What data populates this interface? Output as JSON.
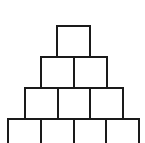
{
  "figure": {
    "title": "Square Pyramid Stack",
    "background_color": "#ffffff",
    "stroke_color": "#1a1a1a",
    "fill_color": "#ffffff",
    "stroke_width": 2,
    "canvas": {
      "width": 145,
      "height": 143
    }
  },
  "chart_data": {
    "type": "bar",
    "title": "Square Pyramid Stack",
    "subtitle": "",
    "xlabel": "",
    "ylabel": "",
    "categories": [
      "Row 1",
      "Row 2",
      "Row 3",
      "Row 4"
    ],
    "values": [
      1,
      2,
      3,
      4
    ],
    "ylim": [
      0,
      4
    ],
    "grid": false,
    "legend": "none",
    "annotations": [],
    "total_squares": 10,
    "square_size": {
      "width": 33,
      "height": 31
    },
    "rows": [
      {
        "index": 1,
        "label": "Row 1",
        "count": 1,
        "y": 26,
        "height": 31,
        "left": 57,
        "width": 33,
        "clipped": false
      },
      {
        "index": 2,
        "label": "Row 2",
        "count": 2,
        "y": 57,
        "height": 31,
        "left": 41,
        "width": 66,
        "clipped": false
      },
      {
        "index": 3,
        "label": "Row 3",
        "count": 3,
        "y": 88,
        "height": 31,
        "left": 25,
        "width": 98,
        "clipped": false
      },
      {
        "index": 4,
        "label": "Row 4",
        "count": 4,
        "y": 119,
        "height": 31,
        "left": 8,
        "width": 131,
        "clipped": true
      }
    ],
    "squares": [
      {
        "id": "r1c1",
        "row": 1,
        "col": 1,
        "x": 57,
        "y": 26,
        "w": 33,
        "h": 31
      },
      {
        "id": "r2c1",
        "row": 2,
        "col": 1,
        "x": 41,
        "y": 57,
        "w": 33,
        "h": 31
      },
      {
        "id": "r2c2",
        "row": 2,
        "col": 2,
        "x": 74,
        "y": 57,
        "w": 33,
        "h": 31
      },
      {
        "id": "r3c1",
        "row": 3,
        "col": 1,
        "x": 25,
        "y": 88,
        "w": 33,
        "h": 31
      },
      {
        "id": "r3c2",
        "row": 3,
        "col": 2,
        "x": 58,
        "y": 88,
        "w": 32,
        "h": 31
      },
      {
        "id": "r3c3",
        "row": 3,
        "col": 3,
        "x": 90,
        "y": 88,
        "w": 33,
        "h": 31
      },
      {
        "id": "r4c1",
        "row": 4,
        "col": 1,
        "x": 8,
        "y": 119,
        "w": 33,
        "h": 31
      },
      {
        "id": "r4c2",
        "row": 4,
        "col": 2,
        "x": 41,
        "y": 119,
        "w": 33,
        "h": 31
      },
      {
        "id": "r4c3",
        "row": 4,
        "col": 3,
        "x": 74,
        "y": 119,
        "w": 32,
        "h": 31
      },
      {
        "id": "r4c4",
        "row": 4,
        "col": 4,
        "x": 106,
        "y": 119,
        "w": 33,
        "h": 31
      }
    ]
  }
}
